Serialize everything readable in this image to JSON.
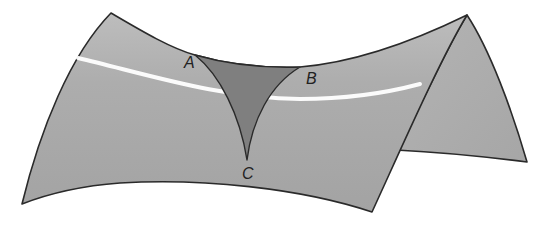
{
  "figure": {
    "colors": {
      "surface": "#a9a9a9",
      "surface_light": "#c8c8c8",
      "triangle": "#7f7f7f",
      "highlight": "#ffffff",
      "outline": "#2a2a2a",
      "background": "#ffffff"
    },
    "vertices": [
      {
        "name": "A",
        "label": "A"
      },
      {
        "name": "B",
        "label": "B"
      },
      {
        "name": "C",
        "label": "C"
      }
    ]
  }
}
